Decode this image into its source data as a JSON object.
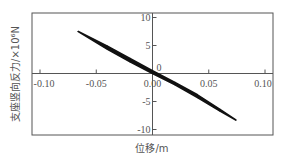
{
  "chart_data": {
    "type": "line",
    "title": "",
    "xlabel": "位移/m",
    "ylabel": "支座竖向反力/×10⁶N",
    "xlim": [
      -0.12,
      0.1
    ],
    "ylim": [
      -11.0,
      11.0
    ],
    "grid": false,
    "legend": null,
    "x_ticks": [
      -0.1,
      -0.05,
      0.0,
      0.05,
      0.1
    ],
    "x_tick_labels": [
      "-0.10",
      "-0.05",
      "0.00",
      "0.05",
      "0.10"
    ],
    "y_ticks": [
      10,
      5,
      0,
      -5,
      -10
    ],
    "y_tick_labels": [
      "10",
      "5",
      "0",
      "-5",
      "-10"
    ],
    "series": [
      {
        "name": "hysteresis-loop",
        "color": "#111111",
        "description": "narrow hysteresis loop, nearly linear, negative slope",
        "x": [
          -0.066,
          -0.04,
          -0.02,
          0.0,
          0.02,
          0.04,
          0.06,
          0.074,
          0.06,
          0.04,
          0.02,
          0.0,
          -0.02,
          -0.04,
          -0.066
        ],
        "y": [
          7.5,
          4.9,
          2.7,
          0.5,
          -1.6,
          -3.8,
          -6.4,
          -8.3,
          -6.7,
          -4.3,
          -2.0,
          0.0,
          2.1,
          4.3,
          7.5
        ]
      }
    ]
  }
}
